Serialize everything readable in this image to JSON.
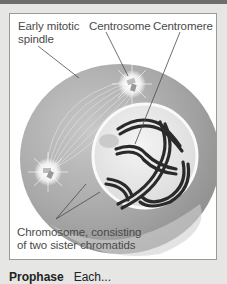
{
  "figure": {
    "labels": {
      "early_mitotic_spindle_line1": "Early mitotic",
      "early_mitotic_spindle_line2": "spindle",
      "centrosome": "Centrosome",
      "centromere": "Centromere",
      "chromosome_line1": "Chromosome, consisting",
      "chromosome_line2": "of two sister chromatids"
    },
    "caption": {
      "title": "Prophase",
      "text": "Each..."
    },
    "colors": {
      "page_background": "#e6e6e4",
      "top_bar": "#6e6e6e",
      "panel_border": "#9a9a9a",
      "cell_cytoplasm": "#a9a9a9",
      "nucleus": "#ececec",
      "chromosome": "#2a2a2a",
      "label_text": "#4a4a4a"
    }
  }
}
